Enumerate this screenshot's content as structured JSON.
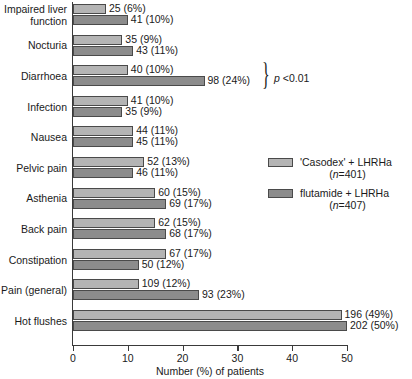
{
  "chart_data": {
    "type": "bar",
    "orientation": "horizontal",
    "title": "",
    "xlabel": "Number (%) of patients",
    "ylabel": "",
    "xlim": [
      0,
      50
    ],
    "xticks": [
      "0",
      "10",
      "20",
      "30",
      "40",
      "50"
    ],
    "grid": false,
    "legend_position": "right",
    "categories": [
      "Impaired liver\nfunction",
      "Nocturia",
      "Diarrhoea",
      "Infection",
      "Nausea",
      "Pelvic pain",
      "Asthenia",
      "Back pain",
      "Constipation",
      "Pain (general)",
      "Hot flushes"
    ],
    "series": [
      {
        "name": "'Casodex' + LHRHa",
        "n": 401,
        "color": "#b4b4b4",
        "values": [
          6,
          9,
          10,
          10,
          11,
          13,
          15,
          15,
          17,
          12,
          49
        ],
        "counts": [
          25,
          35,
          40,
          41,
          44,
          52,
          60,
          62,
          67,
          109,
          196
        ],
        "labels": [
          "25 (6%)",
          "35 (9%)",
          "40 (10%)",
          "41 (10%)",
          "44 (11%)",
          "52 (13%)",
          "60 (15%)",
          "62 (15%)",
          "67 (17%)",
          "109 (12%)",
          "196 (49%)"
        ]
      },
      {
        "name": "flutamide + LHRHa",
        "n": 407,
        "color": "#8c8c8c",
        "values": [
          10,
          11,
          24,
          9,
          11,
          11,
          17,
          17,
          12,
          23,
          50
        ],
        "counts": [
          41,
          43,
          98,
          35,
          45,
          46,
          69,
          68,
          50,
          93,
          202
        ],
        "labels": [
          "41 (10%)",
          "43 (11%)",
          "98 (24%)",
          "35 (9%)",
          "45 (11%)",
          "46 (11%)",
          "69 (17%)",
          "68 (17%)",
          "50 (12%)",
          "93 (23%)",
          "202 (50%)"
        ]
      }
    ],
    "annotations": [
      {
        "id": "diarrhoea-significance",
        "text": "p <0.01",
        "text_prefix_italic": "p",
        "text_rest": " <0.01",
        "bracket": "}",
        "applies_to": "Diarrhoea"
      }
    ]
  },
  "legend": {
    "items": [
      {
        "label": "'Casodex' + LHRHa",
        "sub_prefix": "(",
        "sub_italic": "n",
        "sub_rest": "=401)",
        "swatch": "light"
      },
      {
        "label": "flutamide + LHRHa",
        "sub_prefix": "(",
        "sub_italic": "n",
        "sub_rest": "=407)",
        "swatch": "dark"
      }
    ]
  },
  "axis": {
    "x_title": "Number (%) of patients"
  }
}
